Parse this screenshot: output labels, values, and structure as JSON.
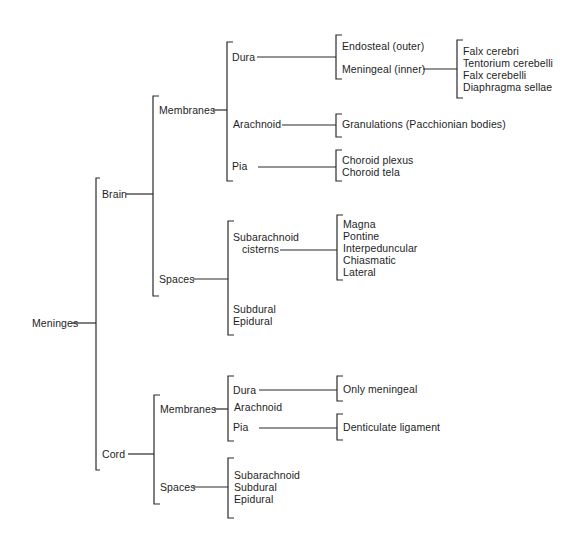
{
  "diagram": {
    "root": "Meninges",
    "brain": {
      "label": "Brain",
      "membranes": {
        "label": "Membranes",
        "dura": {
          "label": "Dura",
          "endosteal": "Endosteal (outer)",
          "meningeal": "Meningeal (inner)",
          "folds": [
            "Falx cerebri",
            "Tentorium cerebelli",
            "Falx cerebelli",
            "Diaphragma sellae"
          ]
        },
        "arachnoid": {
          "label": "Arachnoid",
          "granulations": "Granulations (Pacchionian bodies)"
        },
        "pia": {
          "label": "Pia",
          "items": [
            "Choroid plexus",
            "Choroid tela"
          ]
        }
      },
      "spaces": {
        "label": "Spaces",
        "subarachnoid_line1": "Subarachnoid",
        "subarachnoid_line2": "cisterns",
        "cisterns": [
          "Magna",
          "Pontine",
          "Interpeduncular",
          "Chiasmatic",
          "Lateral"
        ],
        "others": [
          "Subdural",
          "Epidural"
        ]
      }
    },
    "cord": {
      "label": "Cord",
      "membranes": {
        "label": "Membranes",
        "dura": {
          "label": "Dura",
          "detail": "Only meningeal"
        },
        "arachnoid": {
          "label": "Arachnoid"
        },
        "pia": {
          "label": "Pia",
          "detail": "Denticulate ligament"
        }
      },
      "spaces": {
        "label": "Spaces",
        "items": [
          "Subarachnoid",
          "Subdural",
          "Epidural"
        ]
      }
    }
  }
}
